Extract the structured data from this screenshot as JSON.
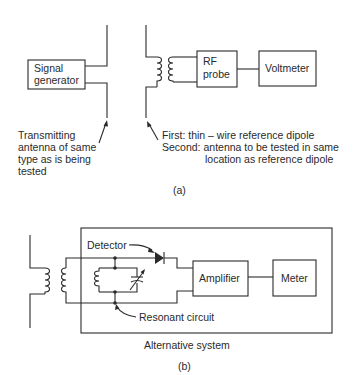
{
  "figure_a": {
    "caption": "(a)",
    "signal_generator": {
      "line1": "Signal",
      "line2": "generator"
    },
    "rf_probe": {
      "line1": "RF",
      "line2": "probe"
    },
    "voltmeter": "Voltmeter",
    "transmit_note": {
      "line1": "Transmitting",
      "line2": "antenna of same",
      "line3": "type as is being",
      "line4": "tested"
    },
    "receive_note": {
      "line1": "First: thin – wire reference dipole",
      "line2": "Second: antenna to be tested in same",
      "line3": "location as reference dipole"
    }
  },
  "figure_b": {
    "caption": "(b)",
    "detector_label": "Detector",
    "resonant_label": "Resonant circuit",
    "amplifier": "Amplifier",
    "meter": "Meter",
    "system_label": "Alternative system"
  }
}
